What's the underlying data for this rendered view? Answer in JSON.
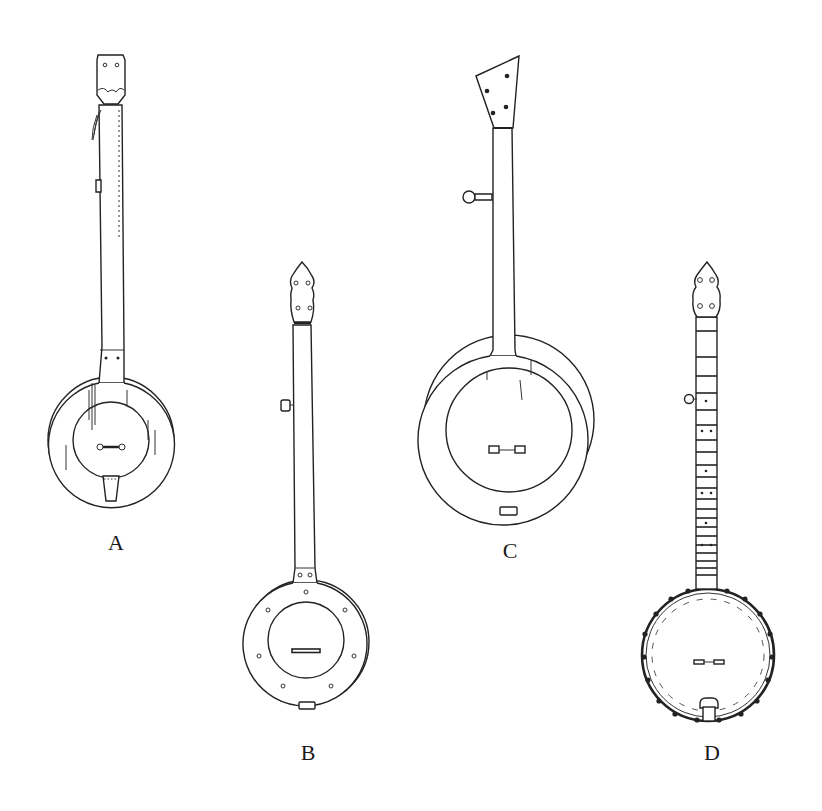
{
  "figure": {
    "type": "line-drawing",
    "background": "#ffffff",
    "ink": "#222222",
    "panels": [
      {
        "label": "A",
        "description": "fretless banjo with square peghead, large wooden rim, tailpiece"
      },
      {
        "label": "B",
        "description": "fretless banjo with scalloped peghead, rim with eight holes, fifth-string peg"
      },
      {
        "label": "C",
        "description": "fretless banjo with angled peghead, open rim"
      },
      {
        "label": "D",
        "description": "fretted banjo with scalloped peghead, position markers, bracketed rim"
      }
    ]
  }
}
